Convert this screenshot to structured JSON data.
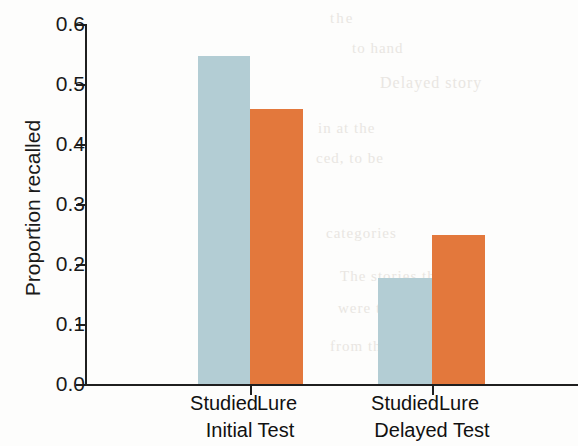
{
  "chart_data": {
    "type": "bar",
    "title": "",
    "xlabel": "",
    "ylabel": "Proportion recalled",
    "ylim": [
      0.0,
      0.6
    ],
    "ytick_labels": [
      "0.0",
      "0.1",
      "0.2",
      "0.3",
      "0.4",
      "0.5",
      "0.6"
    ],
    "ytick_values": [
      0.0,
      0.1,
      0.2,
      0.3,
      0.4,
      0.5,
      0.6
    ],
    "grid": false,
    "legend": "none",
    "groups": [
      "Initial Test",
      "Delayed Test"
    ],
    "categories": [
      "Studied",
      "Lure"
    ],
    "series": [
      {
        "name": "Studied",
        "color": "#b3cdd4",
        "values": [
          0.547,
          0.177
        ]
      },
      {
        "name": "Lure",
        "color": "#e3783c",
        "values": [
          0.459,
          0.249
        ]
      }
    ],
    "bars": [
      {
        "group": "Initial Test",
        "category": "Studied",
        "value": 0.547,
        "color": "#b3cdd4"
      },
      {
        "group": "Initial Test",
        "category": "Lure",
        "value": 0.459,
        "color": "#e3783c"
      },
      {
        "group": "Delayed Test",
        "category": "Studied",
        "value": 0.177,
        "color": "#b3cdd4"
      },
      {
        "group": "Delayed Test",
        "category": "Lure",
        "value": 0.249,
        "color": "#e3783c"
      }
    ]
  },
  "background_bleed": {
    "lines": [
      "the",
      "to hand",
      "Delayed story",
      "in at the",
      "ced, to be",
      "categories",
      "The stories the",
      "were to list",
      "from the"
    ]
  }
}
